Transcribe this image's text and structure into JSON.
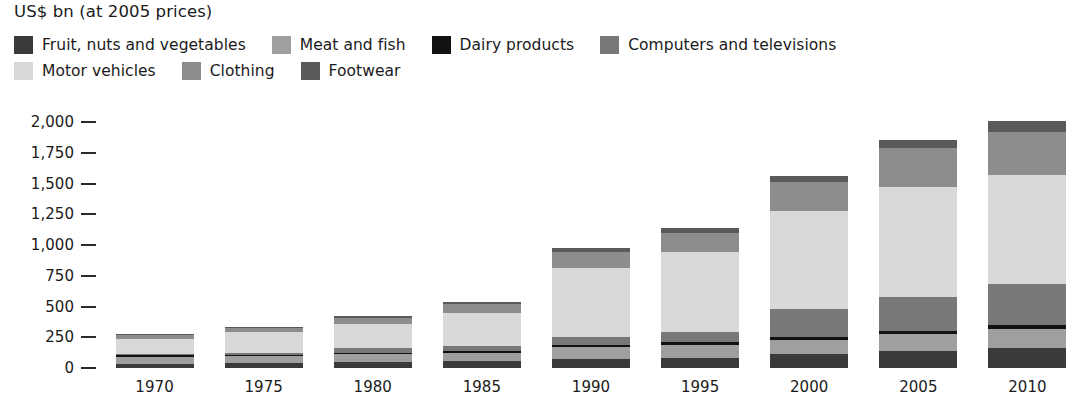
{
  "header": {
    "unit_title": "US$ bn (at 2005 prices)"
  },
  "legend": {
    "rows": [
      [
        {
          "label": "Fruit, nuts and vegetables",
          "color": "#3a3a3a"
        },
        {
          "label": "Meat and fish",
          "color": "#9f9f9f"
        },
        {
          "label": "Dairy products",
          "color": "#111111"
        },
        {
          "label": "Computers and televisions",
          "color": "#787878"
        }
      ],
      [
        {
          "label": "Motor vehicles",
          "color": "#d9d9d9"
        },
        {
          "label": "Clothing",
          "color": "#8d8d8d"
        },
        {
          "label": "Footwear",
          "color": "#5a5a5a"
        }
      ]
    ]
  },
  "axis": {
    "y_ticks": [
      "2,000",
      "1,750",
      "1,500",
      "1,250",
      "1,000",
      "750",
      "500",
      "250",
      "0"
    ]
  },
  "chart_data": {
    "type": "bar",
    "subtype": "stacked",
    "title": "",
    "xlabel": "",
    "ylabel": "US$ bn (at 2005 prices)",
    "ylim": [
      0,
      2000
    ],
    "ytick_values": [
      0,
      250,
      500,
      750,
      1000,
      1250,
      1500,
      1750,
      2000
    ],
    "grid": false,
    "legend_position": "top",
    "categories": [
      "1970",
      "1975",
      "1980",
      "1985",
      "1990",
      "1995",
      "2000",
      "2005",
      "2010"
    ],
    "series": [
      {
        "name": "Fruit, nuts and vegetables",
        "color": "#3a3a3a",
        "values": [
          35,
          40,
          50,
          55,
          75,
          85,
          110,
          135,
          160
        ]
      },
      {
        "name": "Meat and fish",
        "color": "#9f9f9f",
        "values": [
          55,
          55,
          60,
          65,
          95,
          105,
          120,
          140,
          155
        ]
      },
      {
        "name": "Dairy products",
        "color": "#111111",
        "values": [
          15,
          15,
          15,
          15,
          20,
          20,
          25,
          30,
          35
        ]
      },
      {
        "name": "Computers and televisions",
        "color": "#787878",
        "values": [
          10,
          15,
          35,
          45,
          65,
          85,
          225,
          275,
          330
        ]
      },
      {
        "name": "Motor vehicles",
        "color": "#d9d9d9",
        "values": [
          125,
          165,
          200,
          270,
          560,
          645,
          800,
          890,
          890
        ]
      },
      {
        "name": "Clothing",
        "color": "#8d8d8d",
        "values": [
          25,
          35,
          50,
          70,
          125,
          155,
          230,
          320,
          350
        ]
      },
      {
        "name": "Footwear",
        "color": "#5a5a5a",
        "values": [
          10,
          10,
          15,
          20,
          40,
          45,
          50,
          60,
          85
        ]
      }
    ],
    "totals": [
      275,
      335,
      425,
      540,
      980,
      1140,
      1560,
      1850,
      2005
    ]
  }
}
